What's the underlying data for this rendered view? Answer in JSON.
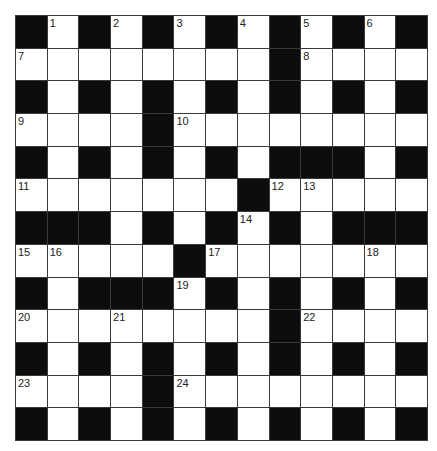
{
  "puzzle": {
    "rows": 13,
    "cols": 13,
    "colors": {
      "block": "#0d0d0d",
      "cell": "#ffffff",
      "line": "#3a3a3a",
      "number": "#222222"
    },
    "grid": [
      "#.#.#.#.#.#.#",
      "........#....",
      "#.#.#.#.#.#.#",
      "....#........",
      "#.#.#.#.###.#",
      ".......#.....",
      "###.#.#.#.###",
      ".....#.......",
      "#.###.#.#.#.#",
      "........#....",
      "#.#.#.#.#.#.#",
      "....#........",
      "#.#.#.#.#.#.#"
    ],
    "numbers": [
      {
        "r": 0,
        "c": 1,
        "n": "1"
      },
      {
        "r": 0,
        "c": 3,
        "n": "2"
      },
      {
        "r": 0,
        "c": 5,
        "n": "3"
      },
      {
        "r": 0,
        "c": 7,
        "n": "4"
      },
      {
        "r": 0,
        "c": 9,
        "n": "5"
      },
      {
        "r": 0,
        "c": 11,
        "n": "6"
      },
      {
        "r": 1,
        "c": 0,
        "n": "7"
      },
      {
        "r": 1,
        "c": 9,
        "n": "8"
      },
      {
        "r": 3,
        "c": 0,
        "n": "9"
      },
      {
        "r": 3,
        "c": 5,
        "n": "10"
      },
      {
        "r": 5,
        "c": 0,
        "n": "11"
      },
      {
        "r": 5,
        "c": 8,
        "n": "12"
      },
      {
        "r": 5,
        "c": 9,
        "n": "13"
      },
      {
        "r": 6,
        "c": 7,
        "n": "14"
      },
      {
        "r": 7,
        "c": 0,
        "n": "15"
      },
      {
        "r": 7,
        "c": 1,
        "n": "16"
      },
      {
        "r": 7,
        "c": 6,
        "n": "17"
      },
      {
        "r": 7,
        "c": 11,
        "n": "18"
      },
      {
        "r": 8,
        "c": 5,
        "n": "19"
      },
      {
        "r": 9,
        "c": 0,
        "n": "20"
      },
      {
        "r": 9,
        "c": 3,
        "n": "21"
      },
      {
        "r": 9,
        "c": 9,
        "n": "22"
      },
      {
        "r": 11,
        "c": 0,
        "n": "23"
      },
      {
        "r": 11,
        "c": 5,
        "n": "24"
      }
    ]
  }
}
